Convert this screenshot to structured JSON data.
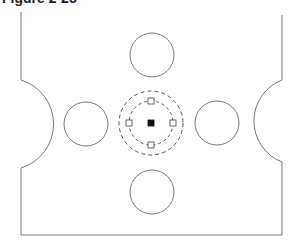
{
  "figure": {
    "caption": "Figure 2-25",
    "caption_cropped": true
  },
  "drawing": {
    "stroke_color": "#777777",
    "outline": {
      "left_x": 21,
      "right_x": 282,
      "top_y": 12,
      "bottom_y": 235,
      "left_notch": {
        "top_y": 80,
        "bottom_y": 168,
        "bulge_x": 46
      },
      "right_notch": {
        "top_y": 80,
        "bottom_y": 162,
        "bulge_x": 257
      }
    },
    "holes": [
      {
        "name": "top",
        "cx": 152,
        "cy": 55,
        "r": 22
      },
      {
        "name": "left",
        "cx": 86,
        "cy": 124,
        "r": 22
      },
      {
        "name": "right",
        "cx": 217,
        "cy": 123,
        "r": 22
      },
      {
        "name": "bottom",
        "cx": 152,
        "cy": 192,
        "r": 22
      }
    ],
    "selected_center": {
      "cx": 151,
      "cy": 123,
      "outer_dashed_r": 32,
      "inner_dashed_r": 22,
      "grips": [
        "north",
        "east",
        "south",
        "west"
      ],
      "center_grip": "filled"
    }
  }
}
